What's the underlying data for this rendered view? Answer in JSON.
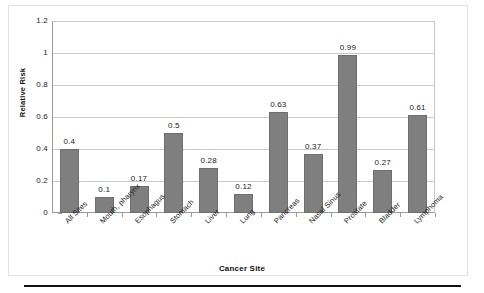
{
  "chart_data": {
    "type": "bar",
    "title": "",
    "xlabel": "Cancer Site",
    "ylabel": "Relative Risk",
    "categories": [
      "All Sites",
      "Mouth, pharynx",
      "Esophagus",
      "Stomach",
      "Liver",
      "Lung",
      "Pancreas",
      "Nasal Sinus",
      "Prostate",
      "Bladder",
      "Lymphoma"
    ],
    "values": [
      0.4,
      0.1,
      0.17,
      0.5,
      0.28,
      0.12,
      0.63,
      0.37,
      0.99,
      0.27,
      0.61
    ],
    "value_labels": [
      "0.4",
      "0.1",
      "0.17",
      "0.5",
      "0.28",
      "0.12",
      "0.63",
      "0.37",
      "0.99",
      "0.27",
      "0.61"
    ],
    "ylim": [
      0,
      1.2
    ],
    "yticks": [
      0,
      0.2,
      0.4,
      0.6,
      0.8,
      1,
      1.2
    ],
    "ytick_labels": [
      "0",
      "0.2",
      "0.4",
      "0.6",
      "0.8",
      "1",
      "1.2"
    ],
    "grid": true,
    "legend": false,
    "bar_color": "#7f7f7f",
    "grid_color": "#c9c9c9",
    "axis_color": "#9a9a9a"
  }
}
